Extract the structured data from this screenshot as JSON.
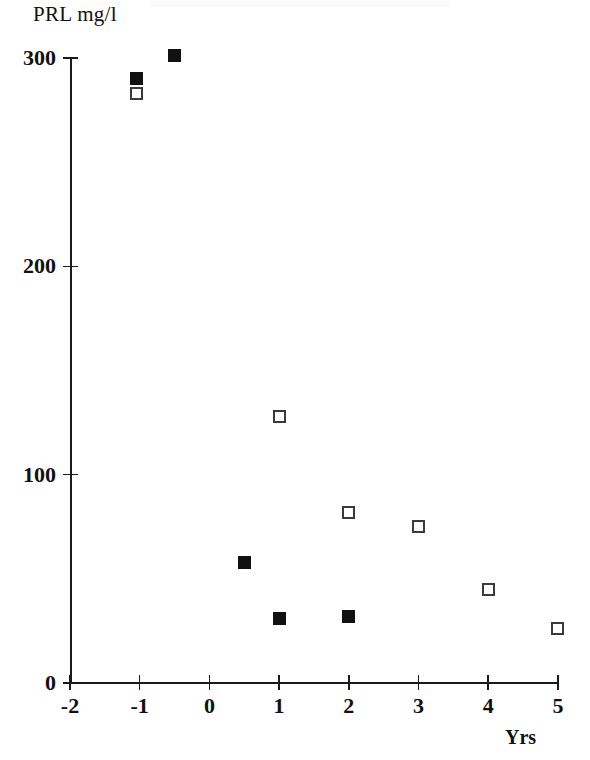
{
  "chart_data": {
    "type": "scatter",
    "title": "",
    "ylabel": "PRL mg/l",
    "xlabel": "Yrs",
    "xlim": [
      -2,
      5
    ],
    "ylim": [
      0,
      300
    ],
    "grid": false,
    "legend": "none",
    "x_ticks": [
      "-2",
      "-1",
      "0",
      "1",
      "2",
      "3",
      "4",
      "5"
    ],
    "x_tick_values": [
      -2,
      -1,
      0,
      1,
      2,
      3,
      4,
      5
    ],
    "y_ticks": [
      "0",
      "100",
      "200",
      "300"
    ],
    "y_tick_values": [
      0,
      100,
      200,
      300
    ],
    "series": [
      {
        "name": "filled-square",
        "marker": "filled square",
        "color": "#111111",
        "points": [
          {
            "x": -1.05,
            "y": 290
          },
          {
            "x": -0.5,
            "y": 301
          },
          {
            "x": 0.5,
            "y": 58
          },
          {
            "x": 1.0,
            "y": 31
          },
          {
            "x": 2.0,
            "y": 32
          }
        ]
      },
      {
        "name": "open-square",
        "marker": "open square",
        "color": "#3a3a3a",
        "points": [
          {
            "x": -1.05,
            "y": 283
          },
          {
            "x": 1.0,
            "y": 128
          },
          {
            "x": 2.0,
            "y": 82
          },
          {
            "x": 3.0,
            "y": 75
          },
          {
            "x": 4.0,
            "y": 45
          },
          {
            "x": 5.0,
            "y": 26
          }
        ]
      }
    ]
  },
  "axis_geometry": {
    "x_origin_px": 70,
    "px_per_x_unit": 69.7,
    "y_zero_px": 683,
    "px_per_y_unit": 2.0833
  }
}
